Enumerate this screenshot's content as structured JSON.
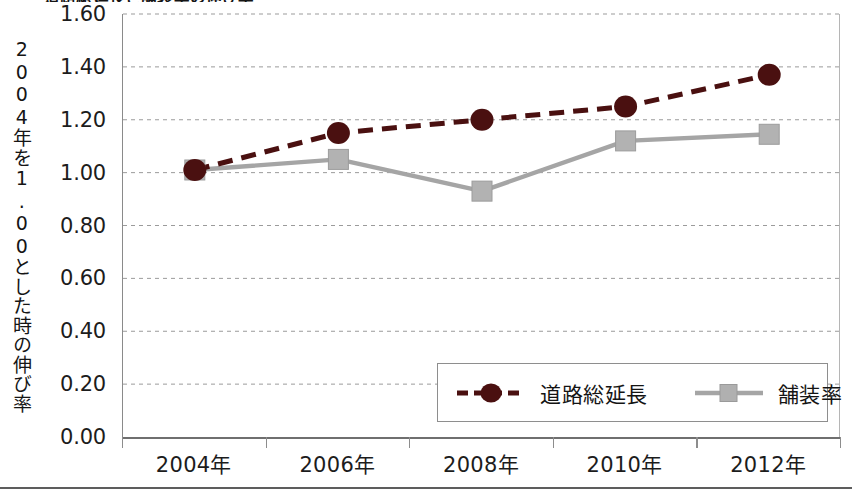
{
  "figure": {
    "title": "道路総延長と舗装率の伸び率",
    "background": "#ffffff"
  },
  "axes": {
    "y_title": "2004年を1.00とした時の伸び率",
    "y_ticks": [
      "1.60",
      "1.40",
      "1.20",
      "1.00",
      "0.80",
      "0.60",
      "0.40",
      "0.20",
      "0.00"
    ],
    "x_ticks": [
      "2004年",
      "2006年",
      "2008年",
      "2010年",
      "2012年"
    ]
  },
  "legend": {
    "items": [
      {
        "label": "道路総延長",
        "color": "#4a1010",
        "style": "dashed",
        "marker": "circle"
      },
      {
        "label": "舗装率",
        "color": "#a5a5a5",
        "style": "solid",
        "marker": "square"
      }
    ]
  },
  "chart_data": {
    "type": "line",
    "title": "道路総延長と舗装率の伸び率",
    "xlabel": "",
    "ylabel": "2004年を1.00とした時の伸び率",
    "categories": [
      "2004年",
      "2006年",
      "2008年",
      "2010年",
      "2012年"
    ],
    "ylim": [
      0.0,
      1.6
    ],
    "ytick_step": 0.2,
    "grid": true,
    "legend_position": "inside-bottom-right",
    "series": [
      {
        "name": "道路総延長",
        "values": [
          1.01,
          1.15,
          1.2,
          1.25,
          1.37
        ],
        "color": "#4a1010",
        "line_style": "dashed",
        "marker": "circle"
      },
      {
        "name": "舗装率",
        "values": [
          1.01,
          1.05,
          0.93,
          1.12,
          1.145
        ],
        "color": "#a5a5a5",
        "line_style": "solid",
        "marker": "square"
      }
    ]
  }
}
